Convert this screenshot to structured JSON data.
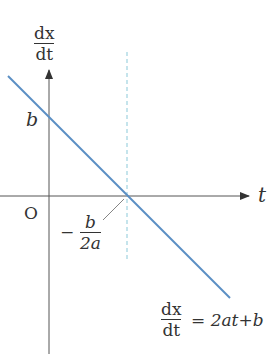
{
  "diagram": {
    "y_axis_label": {
      "num": "dx",
      "den": "dt"
    },
    "x_axis_label": "t",
    "origin_label": "O",
    "y_intercept_label": "b",
    "x_intercept_label": {
      "sign": "−",
      "num": "b",
      "den": "2a"
    },
    "equation": {
      "lhs_num": "dx",
      "lhs_den": "dt",
      "rhs": "= 2at+b"
    },
    "colors": {
      "line": "#5b8fc4",
      "dashed": "#9fd3e0",
      "axis": "#555555"
    }
  }
}
